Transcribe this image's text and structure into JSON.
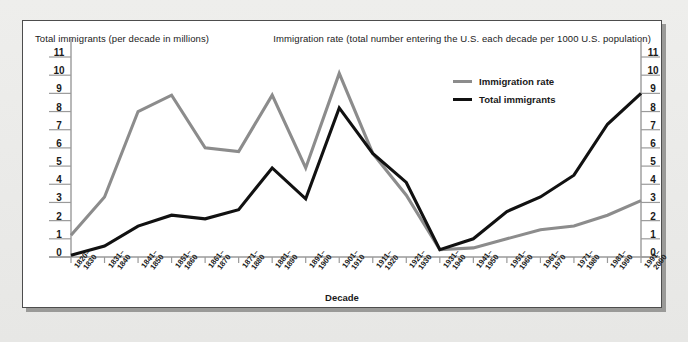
{
  "figure": {
    "left_axis_title": "Total immigrants (per decade in millions)",
    "right_axis_title": "Immigration rate (total number entering the U.S. each decade per 1000 U.S. population)",
    "x_axis_label": "Decade",
    "colors": {
      "immigration_rate": "#8c8c8c",
      "total_immigrants": "#111111",
      "axis": "#9a9a9a",
      "frame": "#4d4d4d",
      "background": "#ffffff",
      "mat": "#eeeeec"
    }
  },
  "legend": {
    "position": "inside-top-right",
    "items": [
      {
        "label": "Immigration rate",
        "color": "#8c8c8c"
      },
      {
        "label": "Total immigrants",
        "color": "#111111"
      }
    ]
  },
  "chart_data": {
    "type": "line",
    "title": "",
    "xlabel": "Decade",
    "ylabel": "Total immigrants (per decade in millions)",
    "y2label": "Immigration rate (total number entering the U.S. each decade per 1000 U.S. population)",
    "ylim": [
      0,
      11
    ],
    "y2lim": [
      0,
      11
    ],
    "yticks": [
      0,
      1,
      2,
      3,
      4,
      5,
      6,
      7,
      8,
      9,
      10,
      11
    ],
    "y2ticks": [
      0,
      1,
      2,
      3,
      4,
      5,
      6,
      7,
      8,
      9,
      10,
      11
    ],
    "grid": false,
    "categories": [
      "1820–1830",
      "1831–1840",
      "1841–1850",
      "1851–1860",
      "1861–1870",
      "1871–1880",
      "1881–1890",
      "1891–1900",
      "1901–1910",
      "1911–1920",
      "1921–1930",
      "1931–1940",
      "1941–1950",
      "1951–1960",
      "1961–1970",
      "1971–1980",
      "1981–1990",
      "1991–2000"
    ],
    "category_lines": [
      [
        "1820–",
        "1830"
      ],
      [
        "1831–",
        "1840"
      ],
      [
        "1841–",
        "1850"
      ],
      [
        "1851–",
        "1860"
      ],
      [
        "1861–",
        "1870"
      ],
      [
        "1871–",
        "1880"
      ],
      [
        "1881–",
        "1890"
      ],
      [
        "1891–",
        "1900"
      ],
      [
        "1901–",
        "1910"
      ],
      [
        "1911–",
        "1920"
      ],
      [
        "1921–",
        "1930"
      ],
      [
        "1931–",
        "1940"
      ],
      [
        "1941–",
        "1950"
      ],
      [
        "1951–",
        "1960"
      ],
      [
        "1961–",
        "1970"
      ],
      [
        "1971–",
        "1980"
      ],
      [
        "1981–",
        "1990"
      ],
      [
        "1991–",
        "2000"
      ]
    ],
    "series": [
      {
        "name": "Immigration rate",
        "color": "#8c8c8c",
        "axis": "right",
        "values": [
          1.2,
          3.3,
          8.0,
          8.9,
          6.0,
          5.8,
          8.9,
          4.9,
          10.1,
          5.7,
          3.4,
          0.4,
          0.5,
          1.0,
          1.5,
          1.7,
          2.3,
          3.1
        ]
      },
      {
        "name": "Total immigrants",
        "color": "#111111",
        "axis": "left",
        "values": [
          0.1,
          0.6,
          1.7,
          2.3,
          2.1,
          2.6,
          4.9,
          3.2,
          8.2,
          5.7,
          4.1,
          0.4,
          1.0,
          2.5,
          3.3,
          4.5,
          7.3,
          9.0
        ]
      }
    ]
  }
}
